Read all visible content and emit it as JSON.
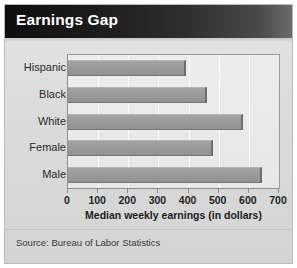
{
  "header": {
    "title": "Earnings Gap"
  },
  "footer": {
    "source_note": "Source: Bureau of Labor Statistics"
  },
  "chart_data": {
    "type": "bar",
    "orientation": "horizontal",
    "title": "Earnings Gap",
    "categories": [
      "Hispanic",
      "Black",
      "White",
      "Female",
      "Male"
    ],
    "values": [
      390,
      460,
      580,
      480,
      645
    ],
    "xlabel": "Median weekly earnings (in dollars)",
    "ylabel": "",
    "xlim": [
      0,
      700
    ],
    "xticks": [
      0,
      100,
      200,
      300,
      400,
      500,
      600,
      700
    ],
    "xtick_labels": [
      "0",
      "100",
      "200",
      "300",
      "400",
      "500",
      "600",
      "700"
    ],
    "grid": "vertical",
    "legend": "none",
    "series": [
      {
        "name": "Median weekly earnings",
        "values": [
          390,
          460,
          580,
          480,
          645
        ]
      }
    ],
    "colors": {
      "bar_fill": "#9a9a9a",
      "bar_edge": "#6d6d6d",
      "plot_background": "#ececec",
      "gridline": "#fbfbfb",
      "title_bar": "#1c1c1c",
      "title_text": "#ffffff",
      "card_background": "#dcdcdc"
    }
  }
}
